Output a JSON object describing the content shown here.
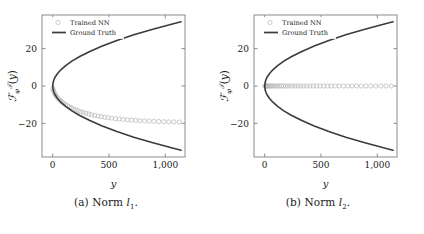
{
  "figure": {
    "panels": [
      {
        "id": "panel-a",
        "caption_prefix": "(a)",
        "caption_word": "Norm",
        "caption_symbol": "l",
        "caption_subscript": "1",
        "legend": {
          "trained_nn": "Trained NN",
          "ground_truth": "Ground Truth"
        },
        "colors": {
          "ground_truth": "#3b3b3b",
          "trained_nn": "#b9b9b9",
          "axis": "#808080"
        },
        "chart_data": {
          "type": "scatter",
          "title": "",
          "xlabel": "y",
          "ylabel": "F_phi^T(y)",
          "xlim": [
            -95,
            1175
          ],
          "ylim": [
            -38,
            38
          ],
          "xticks": [
            0,
            500,
            1000
          ],
          "xticklabels": [
            "0",
            "500",
            "1,000"
          ],
          "yticks": [
            20,
            0,
            -20
          ],
          "yticklabels": [
            "20",
            "0",
            "−20"
          ],
          "grid": false,
          "legend_position": "top-left",
          "series": [
            {
              "name": "Ground Truth",
              "type": "line",
              "comment": "two branches of rightward parabola y_val = +/- sqrt(x)*1.02",
              "x": [
                0,
                5,
                12,
                25,
                45,
                75,
                115,
                170,
                240,
                330,
                440,
                570,
                720,
                890,
                1080,
                1140
              ],
              "values_upper": [
                0.0,
                2.3,
                3.5,
                5.1,
                6.8,
                8.8,
                10.9,
                13.3,
                15.8,
                18.5,
                21.4,
                24.4,
                27.4,
                30.4,
                33.5,
                34.4
              ],
              "values_lower": [
                0.0,
                -2.3,
                -3.5,
                -5.1,
                -6.8,
                -8.8,
                -10.9,
                -13.3,
                -15.8,
                -18.5,
                -21.4,
                -24.4,
                -27.4,
                -30.4,
                -33.5,
                -34.4
              ]
            },
            {
              "name": "Trained NN",
              "type": "scatter",
              "marker": "circle-open",
              "x": [
                2,
                6,
                11,
                17,
                24,
                32,
                41,
                51,
                62,
                74,
                87,
                101,
                116,
                132,
                149,
                167,
                186,
                206,
                227,
                249,
                272,
                296,
                321,
                347,
                374,
                402,
                431,
                461,
                492,
                524,
                557,
                591,
                626,
                662,
                699,
                737,
                776,
                816,
                857,
                899,
                942,
                986,
                1031,
                1077,
                1124
              ],
              "y": [
                -1.2,
                -2.3,
                -3.2,
                -4.0,
                -4.8,
                -5.5,
                -6.2,
                -6.9,
                -7.6,
                -8.2,
                -8.8,
                -9.4,
                -10.0,
                -10.6,
                -11.2,
                -11.8,
                -12.3,
                -12.8,
                -13.3,
                -13.8,
                -14.2,
                -14.6,
                -15.0,
                -15.4,
                -15.8,
                -16.1,
                -16.4,
                -16.7,
                -17.0,
                -17.2,
                -17.5,
                -17.7,
                -17.9,
                -18.1,
                -18.3,
                -18.4,
                -18.6,
                -18.7,
                -18.8,
                -18.9,
                -19.0,
                -19.1,
                -19.2,
                -19.2,
                -19.3
              ]
            }
          ]
        }
      },
      {
        "id": "panel-b",
        "caption_prefix": "(b)",
        "caption_word": "Norm",
        "caption_symbol": "l",
        "caption_subscript": "2",
        "legend": {
          "trained_nn": "Trained NN",
          "ground_truth": "Ground Truth"
        },
        "colors": {
          "ground_truth": "#3b3b3b",
          "trained_nn": "#b9b9b9",
          "axis": "#808080"
        },
        "chart_data": {
          "type": "scatter",
          "title": "",
          "xlabel": "y",
          "ylabel": "F_phi^T(y)",
          "xlim": [
            -95,
            1175
          ],
          "ylim": [
            -38,
            38
          ],
          "xticks": [
            0,
            500,
            1000
          ],
          "xticklabels": [
            "0",
            "500",
            "1,000"
          ],
          "yticks": [
            20,
            0,
            -20
          ],
          "yticklabels": [
            "20",
            "0",
            "−20"
          ],
          "grid": false,
          "legend_position": "top-left",
          "series": [
            {
              "name": "Ground Truth",
              "type": "line",
              "comment": "two branches of rightward parabola",
              "x": [
                0,
                5,
                12,
                25,
                45,
                75,
                115,
                170,
                240,
                330,
                440,
                570,
                720,
                890,
                1080,
                1140
              ],
              "values_upper": [
                0.0,
                2.3,
                3.5,
                5.1,
                6.8,
                8.8,
                10.9,
                13.3,
                15.8,
                18.5,
                21.4,
                24.4,
                27.4,
                30.4,
                33.5,
                34.4
              ],
              "values_lower": [
                0.0,
                -2.3,
                -3.5,
                -5.1,
                -6.8,
                -8.8,
                -10.9,
                -13.3,
                -15.8,
                -18.5,
                -21.4,
                -24.4,
                -27.4,
                -30.4,
                -33.5,
                -34.4
              ]
            },
            {
              "name": "Trained NN",
              "type": "scatter",
              "marker": "circle-open",
              "x": [
                2,
                6,
                11,
                17,
                24,
                32,
                41,
                51,
                62,
                74,
                87,
                101,
                116,
                132,
                149,
                167,
                186,
                206,
                227,
                249,
                272,
                296,
                321,
                347,
                374,
                402,
                431,
                461,
                492,
                524,
                557,
                591,
                626,
                662,
                699,
                737,
                776,
                816,
                857,
                899,
                942,
                986,
                1031,
                1077,
                1124
              ],
              "y": [
                0,
                0,
                0,
                0,
                0,
                0,
                0,
                0,
                0,
                0,
                0,
                0,
                0,
                0,
                0,
                0,
                0,
                0,
                0,
                0,
                0,
                0,
                0,
                0,
                0,
                0,
                0,
                0,
                0,
                0,
                0,
                0,
                0,
                0,
                0,
                0,
                0,
                0,
                0,
                0,
                0,
                0,
                0,
                0,
                0
              ]
            }
          ]
        }
      }
    ]
  }
}
